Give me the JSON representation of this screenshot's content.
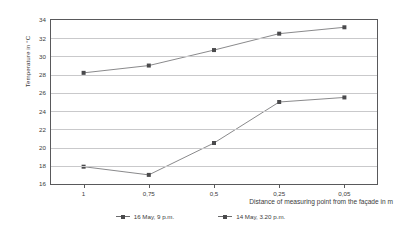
{
  "chart_data": {
    "type": "line",
    "title": "",
    "xlabel": "Distance of measuring point from the façade in m",
    "ylabel": "Temperature in °C",
    "categories": [
      "1",
      "0,75",
      "0,5",
      "0,25",
      "0,05"
    ],
    "x_tick_labels": [
      "1",
      "0,75",
      "0,5",
      "0,25",
      "0,05"
    ],
    "y_tick_labels": [
      "34",
      "32",
      "30",
      "28",
      "26",
      "24",
      "22",
      "20",
      "18",
      "16"
    ],
    "ylim": [
      16,
      34
    ],
    "y_major_step": 2,
    "grid": "horizontal",
    "legend_position": "bottom-center",
    "series": [
      {
        "name": "16 May, 9 p.m.",
        "values": [
          17.9,
          17.0,
          20.5,
          25.0,
          25.5
        ],
        "color": "#6b6b6d",
        "marker": "square"
      },
      {
        "name": "14 May, 3.20 p.m.",
        "values": [
          28.2,
          29.0,
          30.7,
          32.5,
          33.2
        ],
        "color": "#6b6b6d",
        "marker": "square"
      }
    ]
  },
  "style": {
    "axis_color": "#59595b",
    "grid_color": "#c9c9cb",
    "line_color": "#6b6b6d",
    "marker_color": "#4a4a4c",
    "text_color": "#3b3b3b",
    "background": "#ffffff"
  }
}
